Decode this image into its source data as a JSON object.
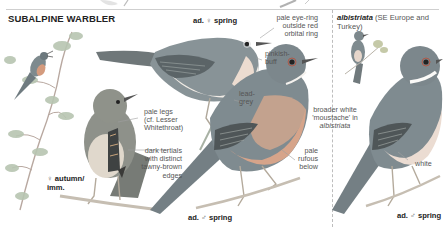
{
  "plate": {
    "species_title": "SUBALPINE WARBLER",
    "subspecies": {
      "name": "albistriata",
      "range": "(SE Europe and Turkey)"
    }
  },
  "figures": [
    {
      "id": "female-spring",
      "age_prefix": "ad.",
      "sex_symbol": "♀",
      "season": "spring"
    },
    {
      "id": "female-autumn",
      "sex_symbol": "♀",
      "season": "autumn/",
      "season_line2": "imm."
    },
    {
      "id": "male-spring",
      "age_prefix": "ad.",
      "sex_symbol": "♂",
      "season": "spring"
    },
    {
      "id": "male-albistriata",
      "age_prefix": "ad.",
      "sex_symbol": "♂",
      "season": "spring"
    }
  ],
  "annotations": {
    "eye_ring": [
      "pale eye-ring",
      "outside red",
      "orbital ring"
    ],
    "pinkish_buff": [
      "pinkish-",
      "buff"
    ],
    "pale_legs": [
      "pale legs",
      "(cf. Lesser",
      "Whitethroat)"
    ],
    "lead_grey": [
      "lead-",
      "grey"
    ],
    "tertials": [
      "dark tertials",
      "with distinct",
      "tawny-brown",
      "edges"
    ],
    "pale_rufous": [
      "pale",
      "rufous",
      "below"
    ],
    "moustache": [
      "broader white",
      "'moustache' in",
      "albistriata"
    ],
    "white": [
      "white"
    ]
  },
  "colors": {
    "background": "#ffffff",
    "text": "#555555",
    "heading": "#222222",
    "bird_upperparts": "#7d8a8f",
    "female_upperparts": "#8f928a",
    "male_underparts": "#d7a58b",
    "albistriata_underparts": "#e9d9cf",
    "wing_dark": "#4f5658",
    "branch": "#b9b3a8",
    "foliage": "#a6b6a0"
  }
}
